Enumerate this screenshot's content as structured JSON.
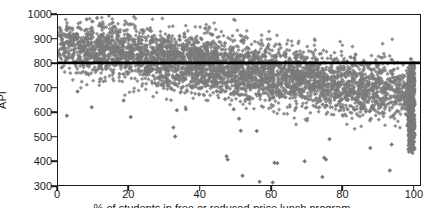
{
  "chart_data": {
    "type": "scatter",
    "title": "",
    "subtitle": "",
    "xlabel": "% of students in free or reduced-price lunch program",
    "ylabel": "API",
    "xlim": [
      0,
      102
    ],
    "ylim": [
      300,
      1000
    ],
    "xticks": [
      0,
      20,
      40,
      60,
      80,
      100
    ],
    "xtick_labels": [
      "0",
      "20",
      "40",
      "60",
      "80",
      "100"
    ],
    "yticks": [
      300,
      400,
      500,
      600,
      700,
      800,
      900,
      1000
    ],
    "ytick_labels": [
      "300",
      "400",
      "500",
      "600",
      "700",
      "800",
      "900",
      "1000"
    ],
    "grid": false,
    "legend": false,
    "legend_position": "none",
    "marker": {
      "shape": "diamond",
      "color": "#7a7a7a",
      "size": 3
    },
    "frame_color": "#1a1a1a",
    "background": "#ffffff",
    "annotations": [
      {
        "type": "hline",
        "label": "API target 800",
        "y": 803,
        "color": "#000000",
        "width": 2.6
      }
    ],
    "series": [
      {
        "name": "California schools",
        "n_points": 4300,
        "description": "Dense negatively-sloped cloud of school API scores versus percentage of students in the free or reduced-price lunch program; scores fall from roughly 820-1000 near 0% down to roughly 450-800 near 100%, with a heavy pile-up of points at 100%.",
        "trend": {
          "type": "linear",
          "intercept_at_x0": 880,
          "slope_per_percent": -2.05,
          "spread_sd_at_x0": 58,
          "spread_sd_at_x100": 62
        },
        "quantile_bands": {
          "x": [
            0,
            10,
            20,
            30,
            40,
            50,
            60,
            70,
            80,
            90,
            100
          ],
          "p05": [
            760,
            720,
            680,
            645,
            615,
            575,
            545,
            520,
            498,
            475,
            455
          ],
          "p25": [
            818,
            782,
            748,
            715,
            688,
            660,
            636,
            615,
            596,
            578,
            560
          ],
          "p50": [
            862,
            822,
            790,
            758,
            730,
            705,
            682,
            662,
            645,
            628,
            612
          ],
          "p75": [
            905,
            866,
            833,
            800,
            772,
            748,
            726,
            707,
            690,
            675,
            662
          ],
          "p95": [
            962,
            925,
            890,
            858,
            830,
            806,
            786,
            768,
            752,
            738,
            726
          ]
        },
        "outliers": [
          {
            "x": 2.5,
            "y": 585
          },
          {
            "x": 5.5,
            "y": 685
          },
          {
            "x": 9.5,
            "y": 620
          },
          {
            "x": 11,
            "y": 988
          },
          {
            "x": 18.5,
            "y": 648
          },
          {
            "x": 20.5,
            "y": 962
          },
          {
            "x": 20.5,
            "y": 580
          },
          {
            "x": 32.5,
            "y": 537
          },
          {
            "x": 33,
            "y": 500
          },
          {
            "x": 33.5,
            "y": 608
          },
          {
            "x": 36,
            "y": 612
          },
          {
            "x": 41.5,
            "y": 945
          },
          {
            "x": 47.5,
            "y": 418
          },
          {
            "x": 47.8,
            "y": 405
          },
          {
            "x": 49.5,
            "y": 612
          },
          {
            "x": 51,
            "y": 573
          },
          {
            "x": 51.5,
            "y": 523
          },
          {
            "x": 52,
            "y": 338
          },
          {
            "x": 56,
            "y": 522
          },
          {
            "x": 56.8,
            "y": 313
          },
          {
            "x": 60.5,
            "y": 310
          },
          {
            "x": 61,
            "y": 392
          },
          {
            "x": 61.8,
            "y": 390
          },
          {
            "x": 69.5,
            "y": 398
          },
          {
            "x": 74.5,
            "y": 333
          },
          {
            "x": 75,
            "y": 412
          },
          {
            "x": 75.5,
            "y": 405
          },
          {
            "x": 76.5,
            "y": 489
          },
          {
            "x": 83.5,
            "y": 823
          },
          {
            "x": 88,
            "y": 452
          },
          {
            "x": 93.5,
            "y": 360
          },
          {
            "x": 94,
            "y": 467
          }
        ],
        "edge_pileup": {
          "x": 100.5,
          "y_range": [
            440,
            790
          ],
          "density": "very high",
          "note": "Vertical band of schools reported at 100% free/reduced-price lunch"
        }
      }
    ]
  }
}
